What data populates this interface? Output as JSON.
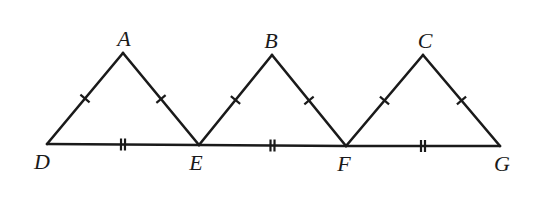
{
  "diagram": {
    "title": "",
    "type": "geometry",
    "colors": {
      "stroke": "#1a1a1a",
      "background": "#ffffff"
    },
    "points": {
      "A": {
        "x": 123,
        "y": 53
      },
      "B": {
        "x": 272,
        "y": 55
      },
      "C": {
        "x": 423,
        "y": 55
      },
      "D": {
        "x": 47,
        "y": 144
      },
      "E": {
        "x": 199,
        "y": 145
      },
      "F": {
        "x": 346,
        "y": 146
      },
      "G": {
        "x": 500,
        "y": 146
      }
    },
    "labels": [
      {
        "text": "A",
        "x": 124,
        "y": 46
      },
      {
        "text": "B",
        "x": 271,
        "y": 48
      },
      {
        "text": "C",
        "x": 425,
        "y": 48
      },
      {
        "text": "D",
        "x": 42,
        "y": 169
      },
      {
        "text": "E",
        "x": 196,
        "y": 170
      },
      {
        "text": "F",
        "x": 344,
        "y": 171
      },
      {
        "text": "G",
        "x": 502,
        "y": 171
      }
    ],
    "segments": [
      {
        "from": "D",
        "to": "A",
        "ticks": 1
      },
      {
        "from": "A",
        "to": "E",
        "ticks": 1
      },
      {
        "from": "E",
        "to": "B",
        "ticks": 1
      },
      {
        "from": "B",
        "to": "F",
        "ticks": 1
      },
      {
        "from": "F",
        "to": "C",
        "ticks": 1
      },
      {
        "from": "C",
        "to": "G",
        "ticks": 1
      },
      {
        "from": "D",
        "to": "E",
        "ticks": 2
      },
      {
        "from": "E",
        "to": "F",
        "ticks": 2
      },
      {
        "from": "F",
        "to": "G",
        "ticks": 2
      }
    ],
    "congruence_marks": {
      "single_tick": [
        "DA",
        "AE",
        "EB",
        "BF",
        "FC",
        "CG"
      ],
      "double_tick": [
        "DE",
        "EF",
        "FG"
      ]
    }
  }
}
